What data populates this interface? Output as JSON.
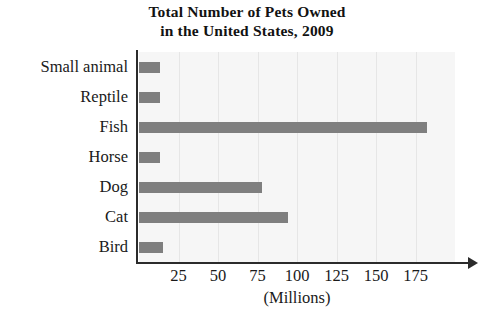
{
  "chart_data": {
    "type": "bar",
    "orientation": "horizontal",
    "title": "Total Number of Pets Owned in the United States, 2009",
    "title_lines": [
      "Total Number of Pets Owned",
      "in the United States, 2009"
    ],
    "categories": [
      "Small animal",
      "Reptile",
      "Fish",
      "Horse",
      "Dog",
      "Cat",
      "Bird"
    ],
    "values": [
      13,
      13,
      182,
      13,
      78,
      94,
      15
    ],
    "xlabel": "(Millions)",
    "ylabel": "",
    "xlim": [
      0,
      200
    ],
    "xticks": [
      25,
      50,
      75,
      100,
      125,
      150,
      175
    ],
    "xtick_labels": [
      "25",
      "50",
      "75",
      "100",
      "125",
      "150",
      "175"
    ],
    "grid": "vertical",
    "legend": null,
    "bar_color": "#7f7f7f",
    "plot_background": "#f6f6f6",
    "axis_color": "#2b2b2b"
  },
  "axis": {
    "caption": "(Millions)",
    "arrow_icon": "axis-arrow-icon"
  }
}
